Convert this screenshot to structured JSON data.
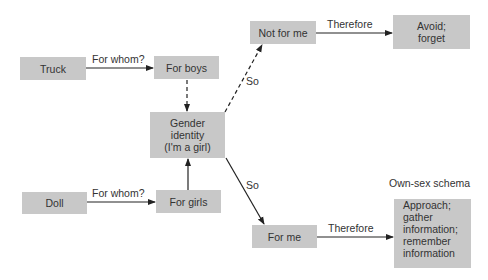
{
  "nodes": {
    "truck": "Truck",
    "for_boys": "For boys",
    "gender_identity": [
      "Gender",
      "identity",
      "(I'm a girl)"
    ],
    "not_for_me": "Not for me",
    "avoid_forget": [
      "Avoid;",
      "forget"
    ],
    "doll": "Doll",
    "for_girls": "For girls",
    "for_me": "For me",
    "approach": [
      "Approach;",
      "gather",
      "information;",
      "remember",
      "information"
    ]
  },
  "edge_labels": {
    "truck_to_boys": "For whom?",
    "doll_to_girls": "For whom?",
    "notforme_to_avoid": "Therefore",
    "forme_to_approach": "Therefore",
    "gi_to_notforme": "So",
    "gi_to_forme": "So"
  },
  "annotations": {
    "own_sex_schema": "Own-sex schema"
  },
  "colors": {
    "box_fill": "#c8c8c8",
    "line": "#222222",
    "text": "#333333"
  }
}
